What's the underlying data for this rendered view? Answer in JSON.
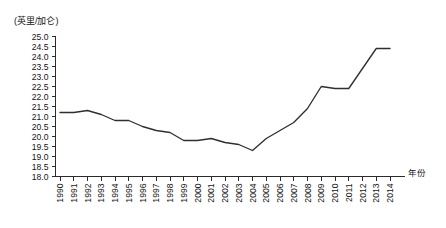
{
  "chart_data": {
    "type": "line",
    "title": "",
    "subtitle": "",
    "unit_label": "(英里/加仑)",
    "xlabel": "年份",
    "ylabel": "",
    "ylim": [
      18.0,
      25.0
    ],
    "ytick_step": 0.5,
    "grid": false,
    "legend": null,
    "yticks": [
      "25.0",
      "24.5",
      "24.0",
      "23.5",
      "23.0",
      "22.5",
      "22.0",
      "21.5",
      "21.0",
      "20.5",
      "20.0",
      "19.5",
      "19.0",
      "18.5",
      "18.0"
    ],
    "categories": [
      "1990",
      "1991",
      "1992",
      "1993",
      "1994",
      "1995",
      "1996",
      "1997",
      "1998",
      "1999",
      "2000",
      "2001",
      "2002",
      "2003",
      "2004",
      "2005",
      "2006",
      "2007",
      "2008",
      "2009",
      "2010",
      "2011",
      "2012",
      "2013",
      "2014"
    ],
    "values": [
      21.2,
      21.2,
      21.3,
      21.1,
      20.8,
      20.8,
      20.5,
      20.3,
      20.2,
      19.8,
      19.8,
      19.9,
      19.7,
      19.6,
      19.3,
      19.9,
      20.3,
      20.7,
      21.4,
      22.5,
      22.4,
      22.4,
      23.4,
      24.4,
      24.4
    ],
    "series": [
      {
        "name": "平均燃油经济性",
        "values": [
          21.2,
          21.2,
          21.3,
          21.1,
          20.8,
          20.8,
          20.5,
          20.3,
          20.2,
          19.8,
          19.8,
          19.9,
          19.7,
          19.6,
          19.3,
          19.9,
          20.3,
          20.7,
          21.4,
          22.5,
          22.4,
          22.4,
          23.4,
          24.4,
          24.4
        ],
        "color": "#2f2f2f"
      }
    ],
    "annotations": []
  }
}
